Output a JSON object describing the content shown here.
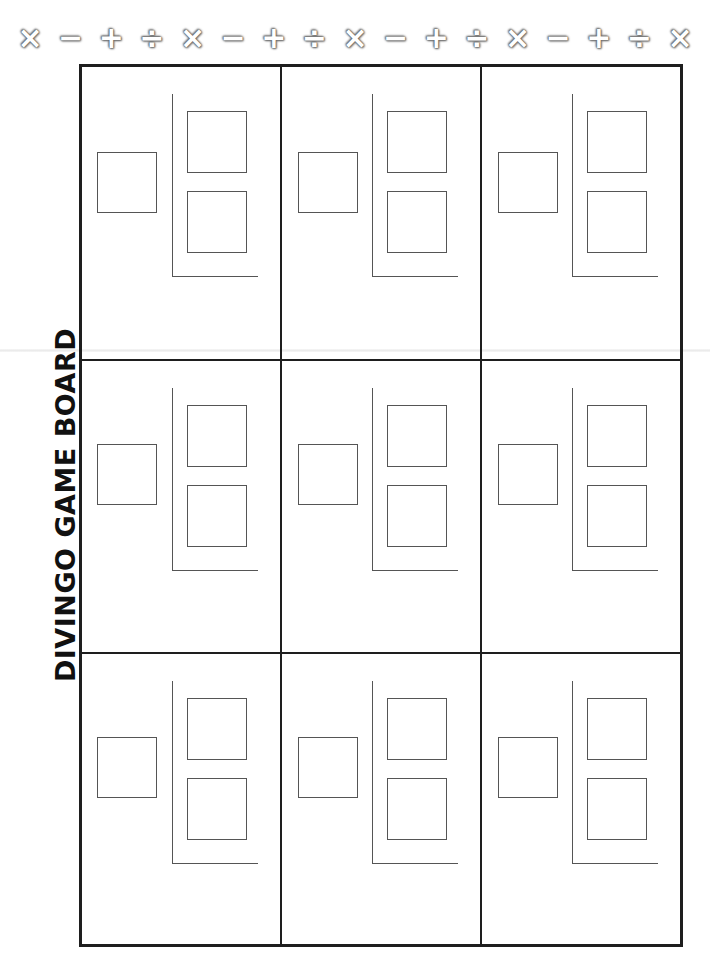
{
  "title": "DIVINGO GAME BOARD",
  "symbol_row": [
    {
      "glyph": "×",
      "name": "multiply"
    },
    {
      "glyph": "−",
      "name": "minus"
    },
    {
      "glyph": "+",
      "name": "plus"
    },
    {
      "glyph": "÷",
      "name": "divide"
    },
    {
      "glyph": "×",
      "name": "multiply"
    },
    {
      "glyph": "−",
      "name": "minus"
    },
    {
      "glyph": "+",
      "name": "plus"
    },
    {
      "glyph": "÷",
      "name": "divide"
    },
    {
      "glyph": "×",
      "name": "multiply"
    },
    {
      "glyph": "−",
      "name": "minus"
    },
    {
      "glyph": "+",
      "name": "plus"
    },
    {
      "glyph": "÷",
      "name": "divide"
    },
    {
      "glyph": "×",
      "name": "multiply"
    },
    {
      "glyph": "−",
      "name": "minus"
    },
    {
      "glyph": "+",
      "name": "plus"
    },
    {
      "glyph": "÷",
      "name": "divide"
    },
    {
      "glyph": "×",
      "name": "multiply"
    }
  ],
  "board": {
    "rows": 3,
    "cols": 3,
    "cells": [
      {
        "row": 0,
        "col": 0,
        "dividend": "",
        "quotient_top": "",
        "quotient_bottom": ""
      },
      {
        "row": 0,
        "col": 1,
        "dividend": "",
        "quotient_top": "",
        "quotient_bottom": ""
      },
      {
        "row": 0,
        "col": 2,
        "dividend": "",
        "quotient_top": "",
        "quotient_bottom": ""
      },
      {
        "row": 1,
        "col": 0,
        "dividend": "",
        "quotient_top": "",
        "quotient_bottom": ""
      },
      {
        "row": 1,
        "col": 1,
        "dividend": "",
        "quotient_top": "",
        "quotient_bottom": ""
      },
      {
        "row": 1,
        "col": 2,
        "dividend": "",
        "quotient_top": "",
        "quotient_bottom": ""
      },
      {
        "row": 2,
        "col": 0,
        "dividend": "",
        "quotient_top": "",
        "quotient_bottom": ""
      },
      {
        "row": 2,
        "col": 1,
        "dividend": "",
        "quotient_top": "",
        "quotient_bottom": ""
      },
      {
        "row": 2,
        "col": 2,
        "dividend": "",
        "quotient_top": "",
        "quotient_bottom": ""
      }
    ]
  },
  "colors": {
    "grid_line": "#1e1e1e",
    "box_line": "#555555",
    "background": "#ffffff"
  }
}
